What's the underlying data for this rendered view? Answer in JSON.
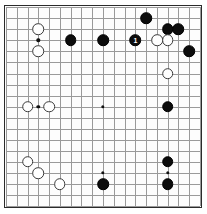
{
  "board": {
    "name": "go-board",
    "size": 19,
    "grid_color": "#9a9a9a",
    "border_color": "#2b2b2b",
    "background_color": "#fdfdfd",
    "black_color": "#0c0c0c",
    "white_color": "#ffffff",
    "origin_x": 6.0,
    "origin_y": 7.2,
    "spacing_x": 10.78,
    "spacing_y": 11.05,
    "stone_diameter": 11.6,
    "hoshi": [
      {
        "col": 3,
        "row": 3
      },
      {
        "col": 9,
        "row": 3
      },
      {
        "col": 15,
        "row": 3
      },
      {
        "col": 3,
        "row": 9
      },
      {
        "col": 9,
        "row": 9
      },
      {
        "col": 15,
        "row": 9
      },
      {
        "col": 3,
        "row": 15
      },
      {
        "col": 9,
        "row": 15
      },
      {
        "col": 15,
        "row": 15
      }
    ]
  },
  "stones": [
    {
      "col": 13,
      "row": 1,
      "color": "black",
      "label": ""
    },
    {
      "col": 15,
      "row": 2,
      "color": "black",
      "label": ""
    },
    {
      "col": 16,
      "row": 2,
      "color": "black",
      "label": ""
    },
    {
      "col": 3,
      "row": 2,
      "color": "white",
      "label": ""
    },
    {
      "col": 6,
      "row": 3,
      "color": "black",
      "label": ""
    },
    {
      "col": 9,
      "row": 3,
      "color": "black",
      "label": ""
    },
    {
      "col": 12,
      "row": 3,
      "color": "black",
      "label": "1"
    },
    {
      "col": 14,
      "row": 3,
      "color": "white",
      "label": ""
    },
    {
      "col": 15,
      "row": 3,
      "color": "white",
      "label": ""
    },
    {
      "col": 3,
      "row": 4,
      "color": "white",
      "label": ""
    },
    {
      "col": 17,
      "row": 4,
      "color": "black",
      "label": ""
    },
    {
      "col": 15,
      "row": 6,
      "color": "white",
      "label": ""
    },
    {
      "col": 2,
      "row": 9,
      "color": "white",
      "label": ""
    },
    {
      "col": 4,
      "row": 9,
      "color": "white",
      "label": ""
    },
    {
      "col": 15,
      "row": 9,
      "color": "black",
      "label": ""
    },
    {
      "col": 2,
      "row": 14,
      "color": "white",
      "label": ""
    },
    {
      "col": 3,
      "row": 15,
      "color": "white",
      "label": ""
    },
    {
      "col": 15,
      "row": 14,
      "color": "black",
      "label": ""
    },
    {
      "col": 5,
      "row": 16,
      "color": "white",
      "label": ""
    },
    {
      "col": 9,
      "row": 16,
      "color": "black",
      "label": ""
    },
    {
      "col": 15,
      "row": 16,
      "color": "black",
      "label": ""
    }
  ]
}
